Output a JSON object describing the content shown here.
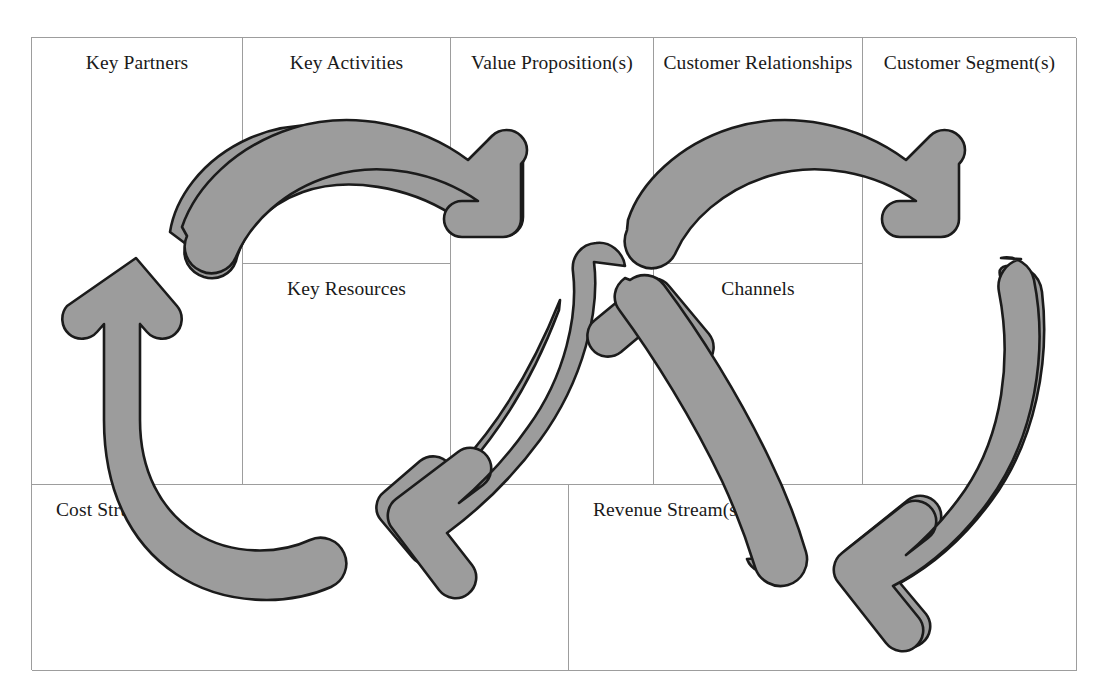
{
  "diagram": {
    "colors": {
      "arrow_fill": "#9c9c9c",
      "arrow_stroke": "#1b1b1b",
      "grid_line": "#9d9d9d",
      "text": "#1a1a1a",
      "background": "#ffffff"
    }
  },
  "canvas": {
    "blocks": {
      "key_partners": "Key Partners",
      "key_activities": "Key Activities",
      "key_resources": "Key Resources",
      "value_propositions": "Value Proposition(s)",
      "customer_relationships": "Customer Relationships",
      "channels": "Channels",
      "customer_segments": "Customer Segment(s)",
      "cost_structure": "Cost Structure",
      "revenue_streams": "Revenue Stream(s)"
    }
  },
  "arrows": {
    "left_cycle": [
      {
        "name": "top-arc-arrow",
        "from": "Key Partners",
        "to": "Value Proposition(s)",
        "direction": "clockwise-top"
      },
      {
        "name": "bottom-right-arrow",
        "from": "Value Proposition(s)",
        "to": "Cost Structure",
        "direction": "clockwise-bottom"
      },
      {
        "name": "left-up-arrow",
        "from": "Cost Structure",
        "to": "Key Partners",
        "direction": "clockwise-left"
      }
    ],
    "right_cycle": [
      {
        "name": "top-arc-arrow",
        "from": "Customer Relationships",
        "to": "Customer Segment(s)",
        "direction": "clockwise-top"
      },
      {
        "name": "right-down-arrow",
        "from": "Customer Segment(s)",
        "to": "Revenue Stream(s)",
        "direction": "clockwise-right"
      },
      {
        "name": "bottom-left-up-arrow",
        "from": "Revenue Stream(s)",
        "to": "Value Proposition(s)",
        "direction": "clockwise-bottom"
      }
    ]
  }
}
